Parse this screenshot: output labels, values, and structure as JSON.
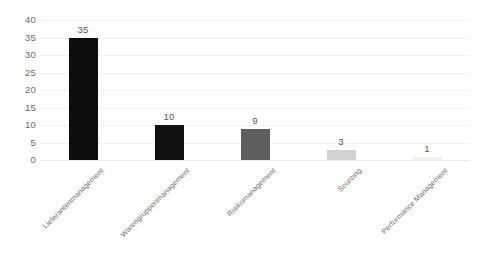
{
  "chart_data": {
    "type": "bar",
    "title": "",
    "subtitle": "",
    "xlabel": "",
    "ylabel": "",
    "categories": [
      "Lieferantenmanagement",
      "Warengruppenmanagement",
      "Risikomanagement",
      "Sourcing",
      "Performance Management"
    ],
    "values": [
      35,
      10,
      9,
      3,
      1
    ],
    "data_labels": [
      "35",
      "10",
      "9",
      "3",
      "1"
    ],
    "bar_colors": [
      "#0d0d0d",
      "#111111",
      "#5e5e5e",
      "#d2d2d2",
      "#f0f0f0"
    ],
    "ylim": [
      0,
      40
    ],
    "ytick_labels": [
      "0",
      "5",
      "10",
      "15",
      "20",
      "25",
      "30",
      "35",
      "40"
    ],
    "ytick_values": [
      0,
      5,
      10,
      15,
      20,
      25,
      30,
      35,
      40
    ],
    "grid": true,
    "grid_axis": "y",
    "gridline_color": "#f2f2f2",
    "legend": false,
    "legend_position": "none",
    "background_color": "#ffffff",
    "label_rotation_degrees": -45,
    "axis_text_color": "#6b6b6b"
  }
}
